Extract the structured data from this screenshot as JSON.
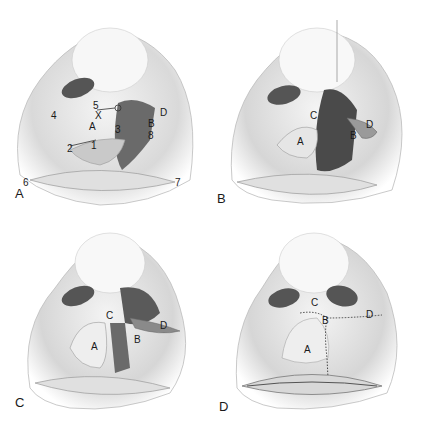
{
  "figure": {
    "panels": [
      {
        "id": "A",
        "caption": "A",
        "labels": [
          {
            "text": "5",
            "x": 93,
            "y": 101
          },
          {
            "text": "X",
            "x": 95,
            "y": 111
          },
          {
            "text": "A",
            "x": 89,
            "y": 122
          },
          {
            "text": "4",
            "x": 51,
            "y": 111
          },
          {
            "text": "2",
            "x": 67,
            "y": 144
          },
          {
            "text": "1",
            "x": 91,
            "y": 141
          },
          {
            "text": "3",
            "x": 115,
            "y": 125
          },
          {
            "text": "D",
            "x": 160,
            "y": 108
          },
          {
            "text": "B",
            "x": 148,
            "y": 119
          },
          {
            "text": "8",
            "x": 148,
            "y": 131
          },
          {
            "text": "6",
            "x": 23,
            "y": 178
          },
          {
            "text": "7",
            "x": 175,
            "y": 178
          }
        ]
      },
      {
        "id": "B",
        "caption": "B",
        "labels": [
          {
            "text": "C",
            "x": 98,
            "y": 111
          },
          {
            "text": "A",
            "x": 85,
            "y": 137
          },
          {
            "text": "B",
            "x": 138,
            "y": 131
          },
          {
            "text": "D",
            "x": 154,
            "y": 120
          }
        ]
      },
      {
        "id": "C",
        "caption": "C",
        "labels": [
          {
            "text": "C",
            "x": 106,
            "y": 93
          },
          {
            "text": "A",
            "x": 91,
            "y": 124
          },
          {
            "text": "B",
            "x": 134,
            "y": 117
          },
          {
            "text": "D",
            "x": 160,
            "y": 103
          }
        ]
      },
      {
        "id": "D",
        "caption": "D",
        "labels": [
          {
            "text": "C",
            "x": 99,
            "y": 80
          },
          {
            "text": "B",
            "x": 110,
            "y": 98
          },
          {
            "text": "D",
            "x": 154,
            "y": 92
          },
          {
            "text": "A",
            "x": 92,
            "y": 127
          }
        ]
      }
    ]
  }
}
